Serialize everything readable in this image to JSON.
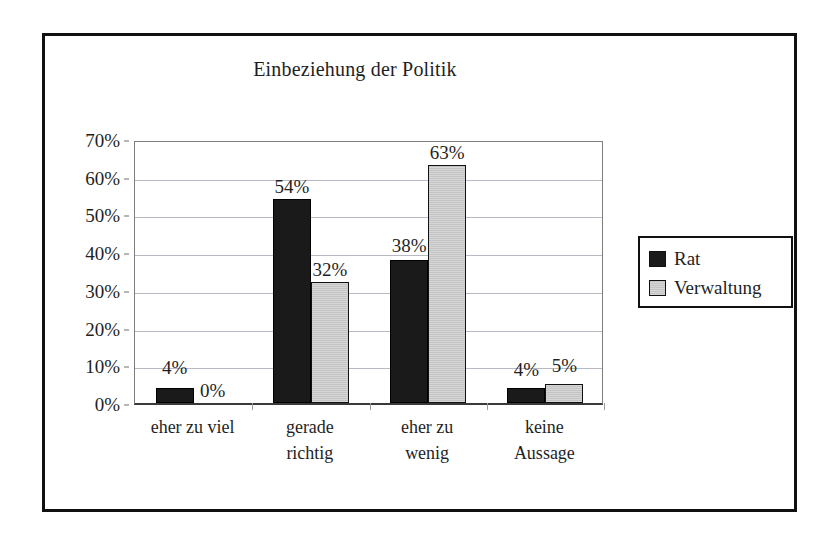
{
  "chart_data": {
    "type": "bar",
    "title": "Einbeziehung der Politik",
    "xlabel": "",
    "ylabel": "",
    "ylim": [
      0,
      70
    ],
    "ytick_labels": [
      "70%",
      "60%",
      "50%",
      "40%",
      "30%",
      "20%",
      "10%",
      "0%"
    ],
    "ytick_values": [
      70,
      60,
      50,
      40,
      30,
      20,
      10,
      0
    ],
    "grid": true,
    "legend_position": "right",
    "categories": [
      "eher zu viel",
      "gerade richtig",
      "eher zu wenig",
      "keine Aussage"
    ],
    "category_lines": [
      [
        "eher zu viel"
      ],
      [
        "gerade",
        "richtig"
      ],
      [
        "eher zu",
        "wenig"
      ],
      [
        "keine",
        "Aussage"
      ]
    ],
    "series": [
      {
        "name": "Rat",
        "color": "#1a1a1a",
        "values": [
          4,
          54,
          38,
          4
        ],
        "labels": [
          "4%",
          "54%",
          "38%",
          "4%"
        ]
      },
      {
        "name": "Verwaltung",
        "color": "#d0d0d0",
        "values": [
          0,
          32,
          63,
          5
        ],
        "labels": [
          "0%",
          "32%",
          "63%",
          "5%"
        ]
      }
    ]
  },
  "legend": {
    "entries": [
      {
        "label": "Rat"
      },
      {
        "label": "Verwaltung"
      }
    ]
  },
  "colors": {
    "frame": "#111111",
    "gridline": "#b9b9c6",
    "series_rat": "#1a1a1a",
    "series_verwaltung": "#d0d0d0",
    "text": "#1f1f1f"
  }
}
